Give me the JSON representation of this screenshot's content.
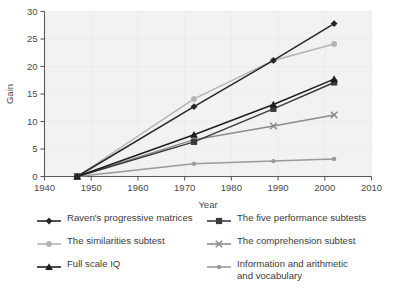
{
  "chart_data": {
    "type": "line",
    "title": "",
    "xlabel": "Year",
    "ylabel": "Gain",
    "xlim": [
      1940,
      2010
    ],
    "ylim": [
      0,
      30
    ],
    "xticks": [
      1940,
      1950,
      1960,
      1970,
      1980,
      1990,
      2000,
      2010
    ],
    "yticks": [
      0,
      5,
      10,
      15,
      20,
      25,
      30
    ],
    "grid": false,
    "legend_position": "below-two-columns",
    "x": [
      1947,
      1972,
      1989,
      2002
    ],
    "series": [
      {
        "name": "Raven's progressive matrices",
        "values": [
          0,
          12.7,
          21.1,
          27.8
        ],
        "color": "#262626",
        "marker": "diamond"
      },
      {
        "name": "The five performance subtests",
        "values": [
          0,
          6.3,
          12.3,
          17.1
        ],
        "color": "#3a3a3a",
        "marker": "square"
      },
      {
        "name": "The similarities subtest",
        "values": [
          0,
          14.1,
          21.1,
          24.1
        ],
        "color": "#b4b4b4",
        "marker": "circle"
      },
      {
        "name": "The comprehension subtest",
        "values": [
          0,
          6.7,
          9.2,
          11.2
        ],
        "color": "#8c8c8c",
        "marker": "x"
      },
      {
        "name": "Full scale IQ",
        "values": [
          0,
          7.6,
          13.1,
          17.7
        ],
        "color": "#1e1e1e",
        "marker": "triangle"
      },
      {
        "name": "Information and arithmetic\nand vocabulary",
        "values": [
          0,
          2.3,
          2.8,
          3.2
        ],
        "color": "#9a9a9a",
        "marker": "circle-small"
      }
    ]
  },
  "axes": {
    "y_title": "Gain",
    "x_title": "Year",
    "x_tick_labels": [
      "1940",
      "1950",
      "1960",
      "1970",
      "1980",
      "1990",
      "2000",
      "2010"
    ],
    "y_tick_labels": [
      "0",
      "5",
      "10",
      "15",
      "20",
      "25",
      "30"
    ]
  },
  "legend": {
    "left": [
      {
        "label": "Raven's progressive matrices",
        "color": "#262626",
        "marker": "diamond"
      },
      {
        "label": "The similarities subtest",
        "color": "#b4b4b4",
        "marker": "circle"
      },
      {
        "label": "Full scale IQ",
        "color": "#1e1e1e",
        "marker": "triangle"
      }
    ],
    "right": [
      {
        "label": "The five performance subtests",
        "color": "#3a3a3a",
        "marker": "square"
      },
      {
        "label": "The comprehension subtest",
        "color": "#8c8c8c",
        "marker": "x"
      },
      {
        "label": "Information and arithmetic\nand vocabulary",
        "color": "#9a9a9a",
        "marker": "circle-small"
      }
    ]
  }
}
